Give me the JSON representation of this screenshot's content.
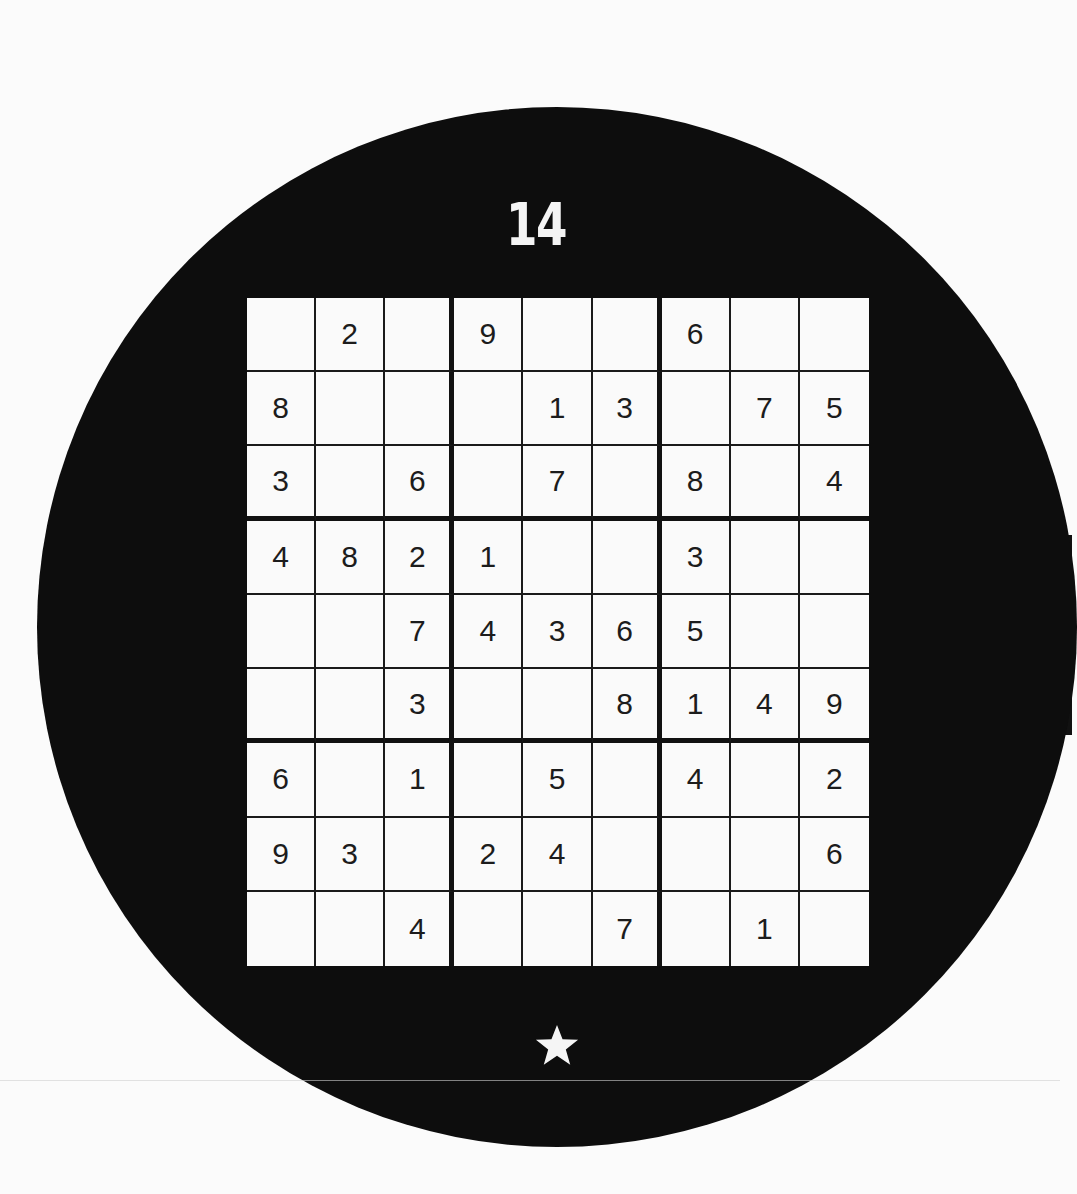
{
  "puzzle": {
    "number": "14",
    "difficulty_icon": "star-icon",
    "difficulty_stars": 1,
    "colors": {
      "background": "#0d0d0d",
      "grid_fill": "#fafafa",
      "digit": "#1c1c1c",
      "title": "#f4f4f4"
    },
    "grid": [
      [
        "",
        "2",
        "",
        "9",
        "",
        "",
        "6",
        "",
        ""
      ],
      [
        "8",
        "",
        "",
        "",
        "1",
        "3",
        "",
        "7",
        "5"
      ],
      [
        "3",
        "",
        "6",
        "",
        "7",
        "",
        "8",
        "",
        "4"
      ],
      [
        "4",
        "8",
        "2",
        "1",
        "",
        "",
        "3",
        "",
        ""
      ],
      [
        "",
        "",
        "7",
        "4",
        "3",
        "6",
        "5",
        "",
        ""
      ],
      [
        "",
        "",
        "3",
        "",
        "",
        "8",
        "1",
        "4",
        "9"
      ],
      [
        "6",
        "",
        "1",
        "",
        "5",
        "",
        "4",
        "",
        "2"
      ],
      [
        "9",
        "3",
        "",
        "2",
        "4",
        "",
        "",
        "",
        "6"
      ],
      [
        "",
        "",
        "4",
        "",
        "",
        "7",
        "",
        "1",
        ""
      ]
    ]
  }
}
